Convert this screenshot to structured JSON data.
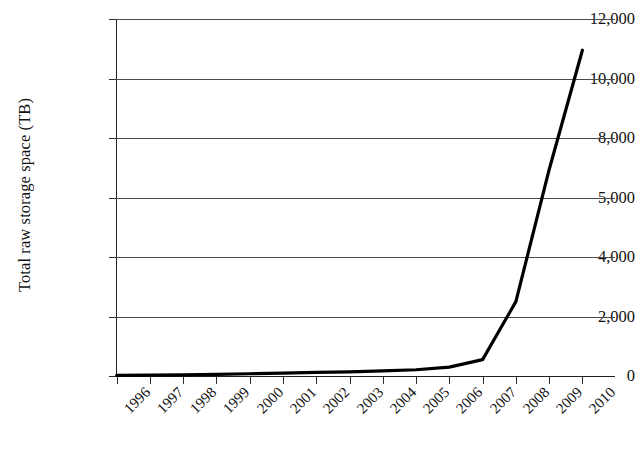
{
  "chart_data": {
    "type": "line",
    "title": "",
    "xlabel": "",
    "ylabel": "Total raw storage space (TB)",
    "x": [
      1996,
      1997,
      1998,
      1999,
      2000,
      2001,
      2002,
      2003,
      2004,
      2005,
      2006,
      2007,
      2008,
      2009,
      2010
    ],
    "categories": [
      "1996",
      "1997",
      "1998",
      "1999",
      "2000",
      "2001",
      "2002",
      "2003",
      "2004",
      "2005",
      "2006",
      "2007",
      "2008",
      "2009",
      "2010"
    ],
    "values": [
      20,
      30,
      40,
      55,
      75,
      95,
      120,
      140,
      170,
      210,
      300,
      550,
      2500,
      6400,
      10950
    ],
    "series": [
      {
        "name": "Total raw storage space",
        "values": [
          20,
          30,
          40,
          55,
          75,
          95,
          120,
          140,
          170,
          210,
          300,
          550,
          2500,
          6400,
          10950
        ]
      }
    ],
    "ylim": [
      0,
      12000
    ],
    "ytick_labels": [
      "0",
      "2,000",
      "4,000",
      "5,000",
      "8,000",
      "10,000",
      "12,000"
    ],
    "ytick_values": [
      0,
      2000,
      4000,
      5000,
      8000,
      10000,
      12000
    ],
    "grid": "horizontal",
    "legend": "none",
    "line_color": "#000000",
    "grid_color": "#4b4b4b",
    "axis_color": "#1f1f1f",
    "background_color": "#ffffff",
    "line_width": 3.2,
    "xtick_rotation": -45
  }
}
